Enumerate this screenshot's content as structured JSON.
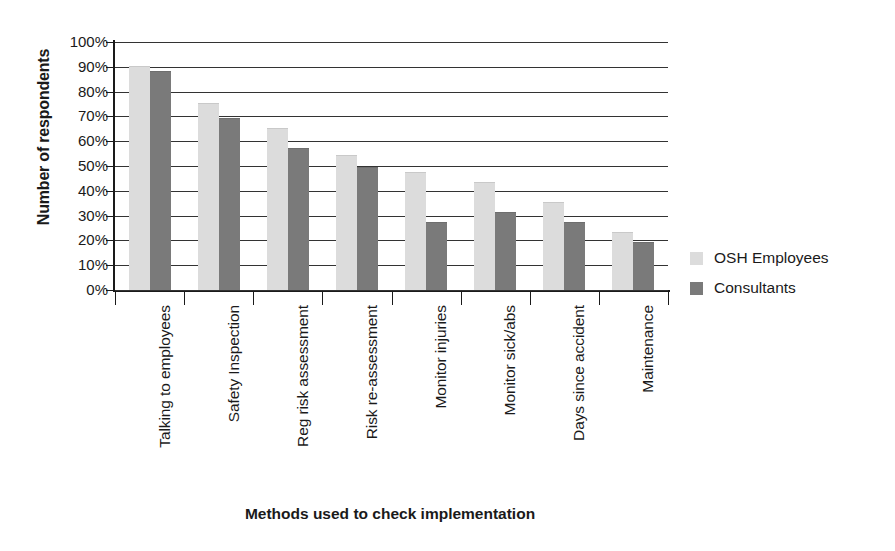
{
  "chart_data": {
    "type": "bar",
    "title": "",
    "xlabel": "Methods used to check implementation",
    "ylabel": "Number of respondents",
    "ylim": [
      0,
      100
    ],
    "ytick_labels": [
      "100%",
      "90%",
      "80%",
      "70%",
      "60%",
      "50%",
      "40%",
      "30%",
      "20%",
      "10%",
      "0%"
    ],
    "ytick_values": [
      100,
      90,
      80,
      70,
      60,
      50,
      40,
      30,
      20,
      10,
      0
    ],
    "grid": true,
    "legend_position": "right",
    "categories": [
      "Talking to employees",
      "Safety Inspection",
      "Reg risk assessment",
      "Risk re-assessment",
      "Monitor injuries",
      "Monitor sick/abs",
      "Days since accident",
      "Maintenance"
    ],
    "series": [
      {
        "name": "OSH Employees",
        "color": "#dcdcdc",
        "values": [
          90,
          75,
          65,
          54,
          47,
          43,
          35,
          23
        ]
      },
      {
        "name": "Consultants",
        "color": "#7a7a7a",
        "values": [
          88,
          69,
          57,
          49,
          27,
          31,
          27,
          19
        ]
      }
    ]
  }
}
